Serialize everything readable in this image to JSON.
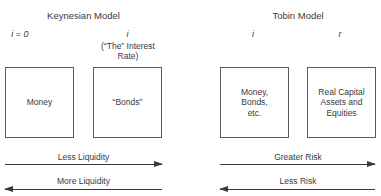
{
  "keynesian": {
    "title": "Keynesian Model",
    "money_rate": "i = 0",
    "bonds_rate": "i",
    "bonds_rate_note": "(“The” Interest\nRate)",
    "boxes": [
      "Money",
      "“Bonds”"
    ],
    "arrows": [
      {
        "label": "Less Liquidity",
        "direction": "right"
      },
      {
        "label": "More Liquidity",
        "direction": "left"
      }
    ]
  },
  "tobin": {
    "title": "Tobin Model",
    "left_rate": "i",
    "right_rate": "r",
    "boxes": [
      "Money,\nBonds,\netc.",
      "Real Capital\nAssets and\nEquities"
    ],
    "arrows": [
      {
        "label": "Greater Risk",
        "direction": "right"
      },
      {
        "label": "Less Risk",
        "direction": "left"
      }
    ]
  }
}
